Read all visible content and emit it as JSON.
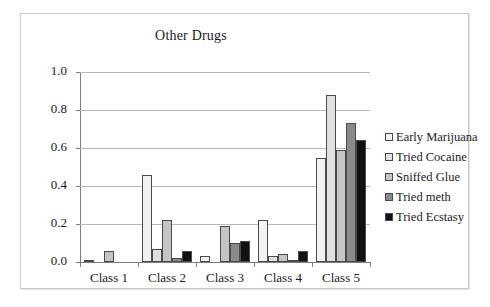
{
  "chart_data": {
    "type": "bar",
    "title": "Other Drugs",
    "xlabel": "",
    "ylabel": "",
    "ylim": [
      0.0,
      1.0
    ],
    "ytick_labels": [
      "0.0",
      "0.2",
      "0.4",
      "0.6",
      "0.8",
      "1.0"
    ],
    "ytick_values": [
      0.0,
      0.2,
      0.4,
      0.6,
      0.8,
      1.0
    ],
    "grid": true,
    "legend_position": "right",
    "categories": [
      "Class 1",
      "Class 2",
      "Class 3",
      "Class 4",
      "Class 5"
    ],
    "series": [
      {
        "name": "Early Marijuana",
        "color": "#f2f2f2",
        "values": [
          0.01,
          0.46,
          0.03,
          0.22,
          0.55
        ]
      },
      {
        "name": "Tried Cocaine",
        "color": "#e0e0e0",
        "values": [
          0.0,
          0.07,
          0.0,
          0.03,
          0.88
        ]
      },
      {
        "name": "Sniffed Glue",
        "color": "#c4c4c4",
        "values": [
          0.06,
          0.22,
          0.19,
          0.04,
          0.59
        ]
      },
      {
        "name": "Tried meth",
        "color": "#8a8a8a",
        "values": [
          0.0,
          0.02,
          0.1,
          0.01,
          0.73
        ]
      },
      {
        "name": "Tried Ecstasy",
        "color": "#111111",
        "values": [
          0.0,
          0.06,
          0.11,
          0.06,
          0.64
        ]
      }
    ]
  }
}
